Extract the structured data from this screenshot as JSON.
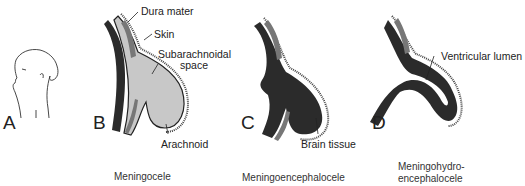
{
  "panels": [
    {
      "letter": "A",
      "caption": ""
    },
    {
      "letter": "B",
      "caption": "Meningocele"
    },
    {
      "letter": "C",
      "caption": "Meningoencephalocele"
    },
    {
      "letter": "D",
      "caption_line1": "Meningohydro-",
      "caption_line2": "encephalocele"
    }
  ],
  "labels": {
    "dura_mater": "Dura mater",
    "skin": "Skin",
    "subarachnoidal_line1": "Subarachnoidal",
    "subarachnoidal_line2": "space",
    "arachnoid": "Arachnoid",
    "brain_tissue": "Brain tissue",
    "ventricular_lumen": "Ventricular lumen"
  },
  "colors": {
    "brain": "#2b2b2b",
    "csf": "#c8c8c8",
    "bone": "#8a8a8a",
    "line": "#222222"
  }
}
